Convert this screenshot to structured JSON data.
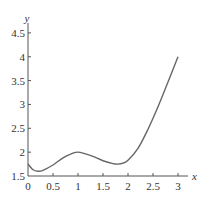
{
  "chart_data": {
    "type": "line",
    "title": "",
    "xlabel": "x",
    "ylabel": "y",
    "xlim": [
      0,
      3
    ],
    "ylim": [
      1.5,
      4.5
    ],
    "grid": false,
    "legend": null,
    "x_ticks": [
      "0",
      "0.5",
      "1",
      "1.5",
      "2",
      "2.5",
      "3"
    ],
    "y_ticks": [
      "1.5",
      "2",
      "2.5",
      "3",
      "3.5",
      "4",
      "4.5"
    ],
    "series": [
      {
        "name": "f(x)",
        "color": "#666666",
        "x": [
          0,
          0.1,
          0.2,
          0.3,
          0.5,
          0.7,
          0.9,
          1.0,
          1.1,
          1.3,
          1.5,
          1.7,
          1.8,
          1.9,
          2.0,
          2.2,
          2.4,
          2.6,
          2.8,
          3.0
        ],
        "y": [
          1.75,
          1.63,
          1.6,
          1.62,
          1.73,
          1.88,
          1.98,
          2.0,
          1.98,
          1.91,
          1.82,
          1.76,
          1.75,
          1.77,
          1.83,
          2.08,
          2.48,
          2.95,
          3.47,
          4.0
        ]
      }
    ]
  }
}
